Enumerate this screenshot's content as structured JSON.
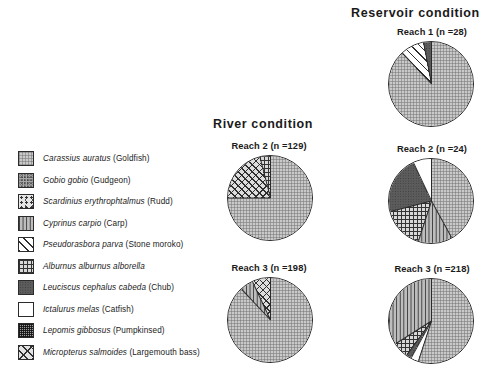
{
  "panels": {
    "river": {
      "title": "River  condition"
    },
    "reservoir": {
      "title": "Reservoir  condition"
    }
  },
  "legend": {
    "items": [
      {
        "pattern": "p-dot",
        "sci": "Carassius auratus",
        "common": "(Goldfish)"
      },
      {
        "pattern": "p-noise",
        "sci": "Gobio gobio",
        "common": "(Gudgeon)"
      },
      {
        "pattern": "p-scatter",
        "sci": "Scardinius erythrophtalmus",
        "common": "(Rudd)"
      },
      {
        "pattern": "p-vert",
        "sci": "Cyprinus carpio",
        "common": "(Carp)"
      },
      {
        "pattern": "p-diag",
        "sci": "Pseudorasbora parva",
        "common": "(Stone moroko)"
      },
      {
        "pattern": "p-grid",
        "sci": "Alburnus alburnus  alborella",
        "common": ""
      },
      {
        "pattern": "p-dark",
        "sci": "Leuciscus cephalus cabeda",
        "common": "(Chub)"
      },
      {
        "pattern": "p-white",
        "sci": "Ictalurus melas",
        "common": "(Catfish)"
      },
      {
        "pattern": "p-fine",
        "sci": "Lepomis gibbosus",
        "common": "(Pumpkinsed)"
      },
      {
        "pattern": "p-xdiag",
        "sci": "Micropterus salmoides",
        "common": "(Largemouth bass)"
      }
    ]
  },
  "charts": {
    "river_reach2": {
      "title": "Reach 2 (n =129)"
    },
    "river_reach3": {
      "title": "Reach 3 (n =198)"
    },
    "res_reach1": {
      "title": "Reach 1 (n =28)"
    },
    "res_reach2": {
      "title": "Reach 2 (n =24)"
    },
    "res_reach3": {
      "title": "Reach 3 (n =218)"
    }
  },
  "chart_data": [
    {
      "type": "pie",
      "title": "Reach 2 (n =129)",
      "panel": "River  condition",
      "n": 129,
      "start_angle": 0,
      "labels": [
        "Carassius auratus",
        "Micropterus salmoides",
        "Alburnus alburnus  alborella"
      ],
      "values": [
        75,
        21,
        4
      ],
      "patterns": [
        "p-dot",
        "p-cross",
        "p-grid"
      ]
    },
    {
      "type": "pie",
      "title": "Reach 3 (n =198)",
      "panel": "River  condition",
      "n": 198,
      "start_angle": 0,
      "labels": [
        "Carassius auratus",
        "Cyprinus carpio",
        "Micropterus salmoides"
      ],
      "values": [
        88,
        5,
        7
      ],
      "patterns": [
        "p-dot",
        "p-vert",
        "p-cross"
      ]
    },
    {
      "type": "pie",
      "title": "Reach 1 (n =28)",
      "panel": "Reservoir  condition",
      "n": 28,
      "start_angle": 0,
      "labels": [
        "Carassius auratus",
        "Pseudorasbora parva",
        "Leuciscus cephalus cabeda"
      ],
      "values": [
        88,
        9,
        3
      ],
      "patterns": [
        "p-dot",
        "p-diag",
        "p-dark"
      ]
    },
    {
      "type": "pie",
      "title": "Reach 2 (n =24)",
      "panel": "Reservoir  condition",
      "n": 24,
      "start_angle": 0,
      "labels": [
        "Carassius auratus",
        "Cyprinus carpio",
        "Alburnus alburnus  alborella",
        "Leuciscus cephalus cabeda",
        "Ictalurus melas"
      ],
      "values": [
        42,
        13,
        16,
        22,
        7
      ],
      "patterns": [
        "p-dot",
        "p-vert",
        "p-grid",
        "p-dark",
        "p-white"
      ]
    },
    {
      "type": "pie",
      "title": "Reach 3 (n =218)",
      "panel": "Reservoir  condition",
      "n": 218,
      "start_angle": 0,
      "labels": [
        "Carassius auratus",
        "Ictalurus melas",
        "Leuciscus cephalus cabeda",
        "Alburnus alburnus  alborella",
        "Cyprinus carpio"
      ],
      "values": [
        55,
        3,
        2,
        6,
        34
      ],
      "patterns": [
        "p-dot",
        "p-white",
        "p-dark",
        "p-grid",
        "p-vert"
      ]
    }
  ]
}
